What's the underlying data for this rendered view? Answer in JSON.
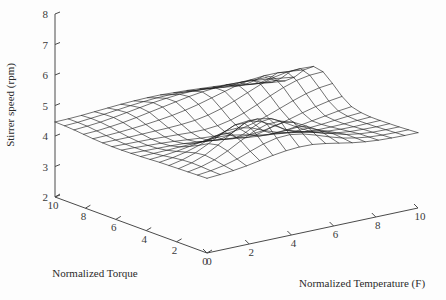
{
  "chart_data": {
    "type": "surface",
    "title": "",
    "xlabel": "Normalized Temperature (F)",
    "ylabel": "Normalized Torque",
    "zlabel": "Stirrer speed (rpm)",
    "grid": true,
    "legend": "none",
    "projection": "3d-wireframe-mesh",
    "xlim": [
      0,
      10
    ],
    "ylim": [
      0,
      10
    ],
    "zlim": [
      2,
      8
    ],
    "x_ticks": [
      0,
      2,
      4,
      6,
      8,
      10
    ],
    "y_ticks": [
      0,
      2,
      4,
      6,
      8,
      10
    ],
    "z_ticks": [
      2,
      3,
      4,
      5,
      6,
      7,
      8
    ],
    "x_tick_labels": [
      "0",
      "2",
      "4",
      "6",
      "8",
      "10"
    ],
    "y_tick_labels": [
      "0",
      "2",
      "4",
      "6",
      "8",
      "10"
    ],
    "z_tick_labels": [
      "2",
      "3",
      "4",
      "5",
      "6",
      "7",
      "8"
    ],
    "x": [
      0,
      0.625,
      1.25,
      1.875,
      2.5,
      3.125,
      3.75,
      4.375,
      5,
      5.625,
      6.25,
      6.875,
      7.5,
      8.125,
      8.75,
      9.375,
      10
    ],
    "y": [
      0,
      0.625,
      1.25,
      1.875,
      2.5,
      3.125,
      3.75,
      4.375,
      5,
      5.625,
      6.25,
      6.875,
      7.5,
      8.125,
      8.75,
      9.375,
      10
    ],
    "z_mean": 4.5,
    "z_observed_min": 3.3,
    "z_observed_max": 5.5,
    "z": [
      [
        4.45,
        4.48,
        4.52,
        4.58,
        4.66,
        4.74,
        4.8,
        4.83,
        4.82,
        4.76,
        4.68,
        4.6,
        4.54,
        4.5,
        4.48,
        4.47,
        4.47
      ],
      [
        4.44,
        4.49,
        4.57,
        4.69,
        4.85,
        5.0,
        5.1,
        5.12,
        5.05,
        4.92,
        4.77,
        4.64,
        4.55,
        4.49,
        4.46,
        4.45,
        4.45
      ],
      [
        4.43,
        4.51,
        4.64,
        4.84,
        5.08,
        5.3,
        5.44,
        5.45,
        5.32,
        5.1,
        4.86,
        4.67,
        4.55,
        4.48,
        4.44,
        4.43,
        4.43
      ],
      [
        4.42,
        4.52,
        4.68,
        4.92,
        5.2,
        5.45,
        5.5,
        5.42,
        5.2,
        4.95,
        4.72,
        4.57,
        4.49,
        4.44,
        4.42,
        4.41,
        4.42
      ],
      [
        4.41,
        4.5,
        4.64,
        4.85,
        5.08,
        5.28,
        5.32,
        5.2,
        4.98,
        4.74,
        4.58,
        4.48,
        4.43,
        4.4,
        4.39,
        4.4,
        4.41
      ],
      [
        4.4,
        4.46,
        4.55,
        4.68,
        4.84,
        4.96,
        4.98,
        4.88,
        4.7,
        4.55,
        4.45,
        4.39,
        4.36,
        4.36,
        4.37,
        4.39,
        4.41
      ],
      [
        4.38,
        4.41,
        4.46,
        4.53,
        4.6,
        4.64,
        4.62,
        4.54,
        4.44,
        4.36,
        4.31,
        4.29,
        4.3,
        4.33,
        4.37,
        4.41,
        4.44
      ],
      [
        4.36,
        4.37,
        4.38,
        4.4,
        4.41,
        4.4,
        4.36,
        4.3,
        4.24,
        4.2,
        4.19,
        4.21,
        4.26,
        4.33,
        4.4,
        4.47,
        4.52
      ],
      [
        4.35,
        4.34,
        4.33,
        4.32,
        4.3,
        4.26,
        4.21,
        4.16,
        4.13,
        4.13,
        4.17,
        4.25,
        4.36,
        4.48,
        4.59,
        4.68,
        4.74
      ],
      [
        4.34,
        4.33,
        4.31,
        4.29,
        4.26,
        4.22,
        4.18,
        4.15,
        4.15,
        4.2,
        4.3,
        4.44,
        4.6,
        4.76,
        4.9,
        5.0,
        5.05
      ],
      [
        4.34,
        4.33,
        4.32,
        4.31,
        4.29,
        4.27,
        4.25,
        4.25,
        4.29,
        4.38,
        4.52,
        4.7,
        4.9,
        5.08,
        5.22,
        5.3,
        5.32
      ],
      [
        4.35,
        4.35,
        4.35,
        4.36,
        4.37,
        4.38,
        4.4,
        4.44,
        4.52,
        4.64,
        4.8,
        4.98,
        5.16,
        5.3,
        5.38,
        5.4,
        5.38
      ],
      [
        4.37,
        4.38,
        4.4,
        4.43,
        4.47,
        4.52,
        4.58,
        4.66,
        4.76,
        4.88,
        5.0,
        5.12,
        5.2,
        5.24,
        5.24,
        5.2,
        5.15
      ],
      [
        4.4,
        4.42,
        4.46,
        4.51,
        4.58,
        4.66,
        4.74,
        4.82,
        4.9,
        4.96,
        5.0,
        5.02,
        5.01,
        4.97,
        4.92,
        4.86,
        4.8
      ],
      [
        4.43,
        4.46,
        4.5,
        4.56,
        4.63,
        4.7,
        4.77,
        4.82,
        4.86,
        4.87,
        4.86,
        4.83,
        4.78,
        4.72,
        4.66,
        4.6,
        4.56
      ],
      [
        4.45,
        4.47,
        4.51,
        4.55,
        4.6,
        4.65,
        4.69,
        4.72,
        4.73,
        4.72,
        4.69,
        4.65,
        4.6,
        4.55,
        4.51,
        4.48,
        4.46
      ],
      [
        4.46,
        4.47,
        4.49,
        4.52,
        4.55,
        4.58,
        4.6,
        4.61,
        4.61,
        4.59,
        4.57,
        4.54,
        4.51,
        4.48,
        4.46,
        4.45,
        4.44
      ]
    ],
    "colors": {
      "mesh": "#1a1a1a",
      "axis": "#4a4a4a",
      "text": "#2b2b2b",
      "background": "#fdfdfd"
    }
  }
}
